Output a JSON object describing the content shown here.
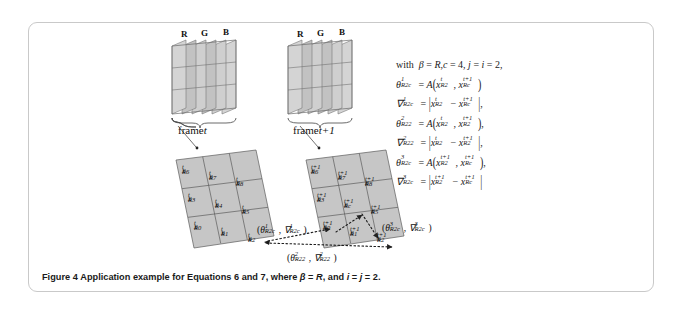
{
  "figure": {
    "caption_label": "Figure 4",
    "caption_text": "Application example for Equations 6 and 7, where",
    "caption_math_1": "β = R",
    "caption_text_2": ", and",
    "caption_math_2": "i = j = 2."
  },
  "channels": {
    "left_stack": [
      "R",
      "G",
      "B"
    ],
    "right_stack": [
      "R",
      "G",
      "B"
    ]
  },
  "frames": {
    "left_label_prefix": "frame",
    "left_label_time": "t",
    "right_label_prefix": "frame",
    "right_label_time": "t+1"
  },
  "grid_left": {
    "superscript": "t",
    "cells": [
      {
        "base": "x",
        "sup": "t",
        "sub": "R6"
      },
      {
        "base": "x",
        "sup": "t",
        "sub": "R7"
      },
      {
        "base": "x",
        "sup": "t",
        "sub": "R8"
      },
      {
        "base": "x",
        "sup": "t",
        "sub": "R3"
      },
      {
        "base": "x",
        "sup": "t",
        "sub": "R4"
      },
      {
        "base": "x",
        "sup": "t",
        "sub": "R5"
      },
      {
        "base": "x",
        "sup": "t",
        "sub": "R0"
      },
      {
        "base": "x",
        "sup": "t",
        "sub": "R1"
      },
      {
        "base": "x",
        "sup": "t",
        "sub": "R2"
      }
    ]
  },
  "grid_right": {
    "superscript": "t+1",
    "cells": [
      {
        "base": "x",
        "sup": "t+1",
        "sub": "R6"
      },
      {
        "base": "x",
        "sup": "t+1",
        "sub": "R7"
      },
      {
        "base": "x",
        "sup": "t+1",
        "sub": "R8"
      },
      {
        "base": "x",
        "sup": "t+1",
        "sub": "R3"
      },
      {
        "base": "x",
        "sup": "t+1",
        "sub": "Rc"
      },
      {
        "base": "x",
        "sup": "t+1",
        "sub": "R5"
      },
      {
        "base": "x",
        "sup": "t+1",
        "sub": "R0"
      },
      {
        "base": "x",
        "sup": "t+1",
        "sub": "R1"
      },
      {
        "base": "x",
        "sup": "t+1",
        "sub": "R2"
      }
    ]
  },
  "annotations": {
    "left_pair": "(θ¹R2c , ∇¹R2c)",
    "right_pair": "(θ³R2c , ∇³R2c)",
    "bottom_pair": "(θ²R22 , ∇²R22)"
  },
  "equations": {
    "intro": "with β = R, c = 4,  j = i = 2,",
    "lines": [
      "θ¹R2c = A(xᵗR2 , xᵗ⁺¹Rc)",
      "∇¹R2c = |xᵗR2 − xᵗ⁺¹Rc|,",
      "θ²R22 = A(xᵗR2 , xᵗ⁺¹R2)",
      "∇²R22 = |xᵗR2 − xᵗ⁺¹R2|,",
      "θ³R2c = A(xᵗ⁺¹R2 , xᵗ⁺¹Rc)",
      "∇³R2c = |xᵗ⁺¹R2 − xᵗ⁺¹Rc|"
    ]
  },
  "colors": {
    "card_border": "#c9c9c9",
    "plane_fill": "#d8d8d8",
    "plane_fill_dark": "#b9b9b9",
    "grid_fill": "#c8c8c8",
    "stroke": "#555555",
    "text": "#1a1a1a"
  }
}
